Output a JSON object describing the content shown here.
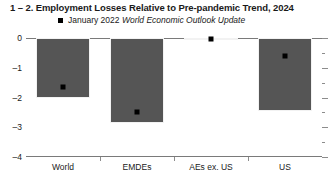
{
  "chart_data": {
    "type": "bar",
    "title": "1 – 2. Employment Losses Relative to Pre-pandemic Trend, 2024",
    "xlabel": "",
    "ylabel": "",
    "categories": [
      "World",
      "EMDEs",
      "AEs ex. US",
      "US"
    ],
    "values": [
      -2.0,
      -2.85,
      -0.05,
      -2.45
    ],
    "series": [
      {
        "name": "January 2022 World Economic Outlook Update",
        "marker": "black-square",
        "values": [
          -1.65,
          -2.5,
          -0.05,
          -0.6
        ]
      }
    ],
    "ylim": [
      -4,
      0
    ],
    "yticks": [
      0,
      -1,
      -2,
      -3,
      -4
    ],
    "ytick_labels": [
      "0",
      "–1",
      "–2",
      "–3",
      "–4"
    ],
    "yminor_ticks": [
      -0.5,
      -1.5,
      -2.5,
      -3.5
    ],
    "grid": false,
    "legend_position": "top-left",
    "bar_color": "#555555",
    "marker_color": "#000000",
    "axis_color": "#7a7a7a"
  },
  "legend": {
    "marker_name": "black-square-marker",
    "label_plain": "January 2022 ",
    "label_italic": "World Economic Outlook Update"
  }
}
